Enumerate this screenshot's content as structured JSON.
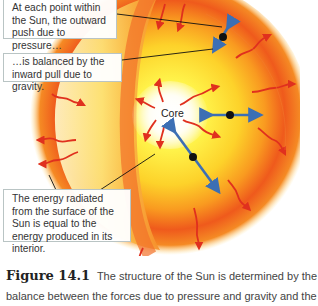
{
  "figure": {
    "callouts": [
      {
        "id": "pressure",
        "text": "At each point within the Sun, the outward push due to pressure…"
      },
      {
        "id": "gravity",
        "text": "…is balanced by the inward pull due to gravity."
      },
      {
        "id": "energy",
        "text": "The energy radiated from the surface of the Sun is equal to the energy produced in its interior."
      }
    ],
    "core_label": "Core",
    "colors": {
      "outer_red": "#e8401a",
      "mid_orange": "#f7931e",
      "inner_yellow": "#fff04a",
      "core_white": "#ffffff",
      "arrow_blue": "#3c6fb4",
      "wave_red": "#e0301e"
    }
  },
  "caption": {
    "figure_number": "Figure 14.1",
    "line1": "The structure of the Sun is determined by the",
    "line2": "balance between the forces due to pressure and gravity and the"
  }
}
